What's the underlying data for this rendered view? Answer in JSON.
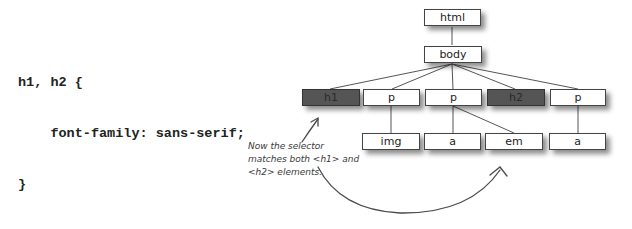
{
  "code": {
    "lines": [
      "h1, h2 {",
      "    font-family: sans-serif;",
      "}"
    ]
  },
  "tree": {
    "root": {
      "label": "html"
    },
    "body": {
      "label": "body"
    },
    "level2": [
      {
        "label": "h1",
        "highlighted": true
      },
      {
        "label": "p",
        "highlighted": false
      },
      {
        "label": "p",
        "highlighted": false
      },
      {
        "label": "h2",
        "highlighted": true
      },
      {
        "label": "p",
        "highlighted": false
      }
    ],
    "level3": [
      {
        "label": "img",
        "parent": 1
      },
      {
        "label": "a",
        "parent": 2
      },
      {
        "label": "em",
        "parent": 2
      },
      {
        "label": "a",
        "parent": 4
      }
    ]
  },
  "annotation": {
    "lines": [
      "Now the selector",
      "matches both <h1> and",
      "<h2> elements."
    ]
  },
  "colors": {
    "highlight_fill": "#555555",
    "node_fill": "#ffffff",
    "edge": "#555555"
  }
}
